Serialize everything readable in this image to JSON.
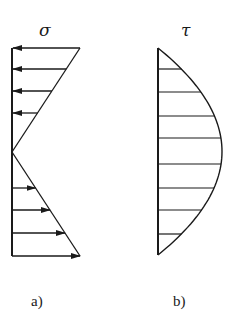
{
  "colors": {
    "ink": "#1a1a1a",
    "background": "#ffffff"
  },
  "diagram_a": {
    "symbol": "σ",
    "label": "a)",
    "axis": {
      "x": 12,
      "y_top": 48,
      "y_bottom": 256
    },
    "zero_y": 152,
    "max_len": 68,
    "arrows_top": [
      48,
      69,
      91,
      113
    ],
    "arrows_bottom": [
      188,
      210,
      233,
      256
    ]
  },
  "diagram_b": {
    "symbol": "τ",
    "label": "b)",
    "axis": {
      "x": 158,
      "y_top": 48,
      "y_bottom": 255
    },
    "max_len": 64,
    "hatch_lines": [
      69,
      92,
      116,
      138,
      164,
      188,
      210,
      234
    ]
  }
}
